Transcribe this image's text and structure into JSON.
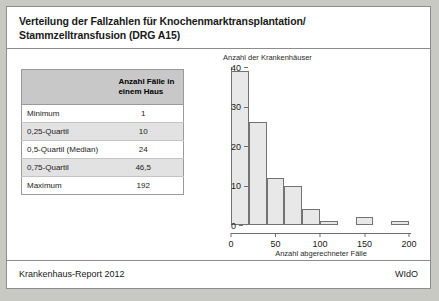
{
  "title": {
    "line1": "Verteilung der Fallzahlen für Knochenmarktransplantation/",
    "line2": "Stammzelltransfusion (DRG A15)"
  },
  "table": {
    "header_value": "Anzahl Fälle in einem Haus",
    "rows": [
      {
        "label": "Minimum",
        "value": "1",
        "shaded": false
      },
      {
        "label": "0,25-Quartil",
        "value": "10",
        "shaded": true
      },
      {
        "label": "0,5-Quartil (Median)",
        "value": "24",
        "shaded": false
      },
      {
        "label": "0,75-Quartil",
        "value": "46,5",
        "shaded": true
      },
      {
        "label": "Maximum",
        "value": "192",
        "shaded": false
      }
    ]
  },
  "footer": {
    "left": "Krankenhaus-Report 2012",
    "right": "WIdO"
  },
  "colors": {
    "bar_fill": "#e8e8e8",
    "bar_border": "#737373",
    "table_header": "#c8c8c8",
    "row_shaded": "#e2e2e2",
    "frame": "#8d8d8d"
  },
  "chart_data": {
    "type": "bar",
    "title": "",
    "xlabel": "Anzahl abgerechneter Fälle",
    "ylabel": "Anzahl der Krankenhäuser",
    "xlim": [
      0,
      200
    ],
    "ylim": [
      0,
      40
    ],
    "xticks": [
      0,
      50,
      100,
      150,
      200
    ],
    "yticks": [
      0,
      10,
      20,
      30,
      40
    ],
    "grid": false,
    "legend": "none",
    "bin_width": 20,
    "bin_edges": [
      0,
      20,
      40,
      60,
      80,
      100,
      120,
      140,
      160,
      180,
      200
    ],
    "categories": [
      "0–20",
      "20–40",
      "40–60",
      "60–80",
      "80–100",
      "100–120",
      "120–140",
      "140–160",
      "160–180",
      "180–200"
    ],
    "values": [
      39,
      26,
      12,
      10,
      4,
      1,
      0,
      2,
      0,
      1
    ]
  }
}
